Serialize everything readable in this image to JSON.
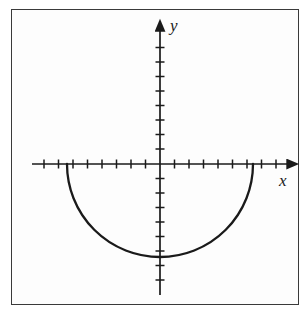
{
  "figure": {
    "title": "",
    "background_color": "#ffffff",
    "frame_color": "#3a3a3a",
    "curve_color": "#1a1a1a",
    "axis_color": "#1a1a1a"
  },
  "axes": {
    "x_label": "x",
    "y_label": "y",
    "origin_px": {
      "x": 160,
      "y": 164
    },
    "tick_spacing_px": 14.5,
    "x_axis_start_px": 32,
    "x_axis_end_px": 296,
    "y_axis_top_px": 22,
    "y_axis_bottom_px": 295,
    "x_ticks_left_count": 8,
    "x_ticks_right_count": 8,
    "y_ticks_above_count": 8,
    "y_ticks_below_count": 8,
    "tick_half_length_px": 4.5,
    "arrow_x_name": "x-axis-arrowhead",
    "arrow_y_name": "y-axis-arrowhead"
  },
  "chart_data": {
    "type": "line",
    "title": "",
    "xlabel": "x",
    "ylabel": "y",
    "grid": false,
    "legend": null,
    "curve": {
      "name": "lower-semicircle",
      "equation": "y = -sqrt(r^2 - x^2)",
      "center": [
        0,
        0
      ],
      "radius_units": 6.4,
      "radius_px": 93,
      "x_intercepts_units": [
        -6.4,
        6.4
      ],
      "minimum_units": [
        0,
        -6.4
      ],
      "x": [
        -6.4,
        -6.0,
        -5.5,
        -5.0,
        -4.0,
        -3.0,
        -2.0,
        -1.0,
        0.0,
        1.0,
        2.0,
        3.0,
        4.0,
        5.0,
        5.5,
        6.0,
        6.4
      ],
      "y": [
        0.0,
        -2.23,
        -3.27,
        -3.99,
        -5.0,
        -5.65,
        -6.08,
        -6.32,
        -6.4,
        -6.32,
        -6.08,
        -5.65,
        -5.0,
        -3.99,
        -3.27,
        -2.23,
        0.0
      ]
    },
    "xlim": [
      -8.8,
      9.4
    ],
    "ylim": [
      -9.0,
      9.8
    ]
  }
}
